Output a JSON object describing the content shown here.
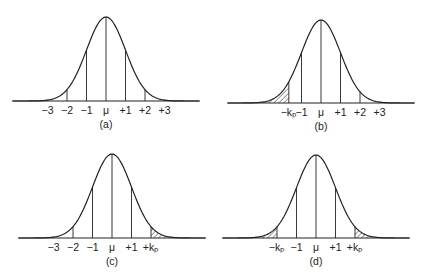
{
  "figure": {
    "panels": [
      {
        "id": "a",
        "caption": "(a)",
        "mu_x": 106,
        "baseline_y": 101,
        "peak_y": 17,
        "sigma_px": 19.5,
        "tick_labels": [
          {
            "text": "−3",
            "at": -3
          },
          {
            "text": "−2",
            "at": -2
          },
          {
            "text": "−1",
            "at": -1
          },
          {
            "text": "μ",
            "at": 0
          },
          {
            "text": "+1",
            "at": 1
          },
          {
            "text": "+2",
            "at": 2
          },
          {
            "text": "+3",
            "at": 3
          }
        ],
        "lines_at": [
          -3,
          -2,
          -1,
          0,
          1,
          2,
          3
        ],
        "shaded": []
      },
      {
        "id": "b",
        "caption": "(b)",
        "mu_x": 321,
        "baseline_y": 103,
        "peak_y": 20,
        "sigma_px": 19.5,
        "tick_labels": [
          {
            "text": "−kₚ",
            "at": -1.65
          },
          {
            "text": "−1",
            "at": -1
          },
          {
            "text": "μ",
            "at": 0
          },
          {
            "text": "+1",
            "at": 1
          },
          {
            "text": "+2",
            "at": 2
          },
          {
            "text": "+3",
            "at": 3
          }
        ],
        "lines_at": [
          -1.65,
          -1,
          0,
          1,
          2,
          3
        ],
        "shaded": [
          "left"
        ]
      },
      {
        "id": "c",
        "caption": "(c)",
        "mu_x": 112,
        "baseline_y": 238,
        "peak_y": 154,
        "sigma_px": 19.5,
        "tick_labels": [
          {
            "text": "−3",
            "at": -3
          },
          {
            "text": "−2",
            "at": -2
          },
          {
            "text": "−1",
            "at": -1
          },
          {
            "text": "μ",
            "at": 0
          },
          {
            "text": "+1",
            "at": 1
          },
          {
            "text": "+kₚ",
            "at": 2
          }
        ],
        "lines_at": [
          -3,
          -2,
          -1,
          0,
          1,
          2
        ],
        "shaded": [
          "right"
        ]
      },
      {
        "id": "d",
        "caption": "(d)",
        "mu_x": 316,
        "baseline_y": 238,
        "peak_y": 155,
        "sigma_px": 19.5,
        "tick_labels": [
          {
            "text": "−kₚ",
            "at": -2
          },
          {
            "text": "−1",
            "at": -1
          },
          {
            "text": "μ",
            "at": 0
          },
          {
            "text": "+1",
            "at": 1
          },
          {
            "text": "+kₚ",
            "at": 2
          }
        ],
        "lines_at": [
          -2,
          -1,
          0,
          1,
          2
        ],
        "shaded": [
          "left",
          "right"
        ]
      }
    ],
    "colors": {
      "ink": "#222222",
      "background": "#ffffff"
    }
  }
}
